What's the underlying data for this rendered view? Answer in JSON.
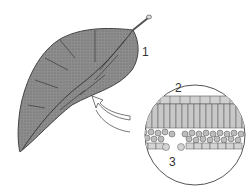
{
  "diagram": {
    "type": "biology-illustration",
    "labels": [
      {
        "id": "1",
        "text": "1",
        "target": "leaf"
      },
      {
        "id": "2",
        "text": "2",
        "target": "upper side of cross-section"
      },
      {
        "id": "3",
        "text": "3",
        "target": "lower side of cross-section"
      }
    ],
    "colors": {
      "leaf_fill": "#8a8a8a",
      "leaf_light": "#b5b5b5",
      "outline": "#444444",
      "cell_fill": "#d8d8d8",
      "background": "#ffffff"
    }
  }
}
